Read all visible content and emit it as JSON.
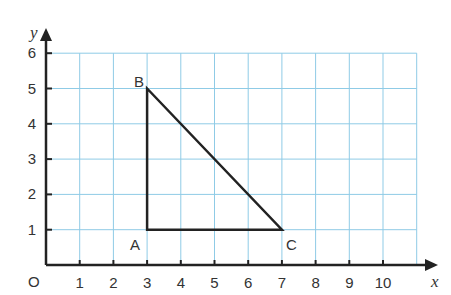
{
  "figure": {
    "type": "coordinate-grid",
    "x_axis": {
      "label": "x",
      "ticks": [
        "1",
        "2",
        "3",
        "4",
        "5",
        "6",
        "7",
        "8",
        "9",
        "10"
      ],
      "min": 0,
      "max": 11
    },
    "y_axis": {
      "label": "y",
      "ticks": [
        "1",
        "2",
        "3",
        "4",
        "5",
        "6"
      ],
      "min": 0,
      "max": 6
    },
    "origin_label": "O",
    "grid_color": "#8fcbe6",
    "line_color": "#222222",
    "triangle": {
      "points": [
        {
          "name": "A",
          "x": 3,
          "y": 1
        },
        {
          "name": "B",
          "x": 3,
          "y": 5
        },
        {
          "name": "C",
          "x": 7,
          "y": 1
        }
      ]
    }
  }
}
